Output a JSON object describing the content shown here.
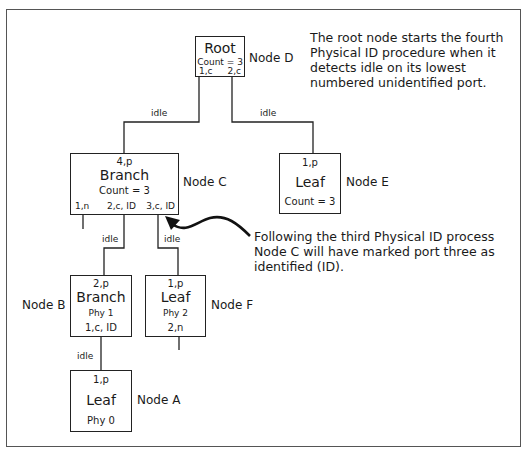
{
  "nodes": {
    "root": {
      "title": "Root",
      "count": "Count = 3",
      "port1": "1,c",
      "port2": "2,c",
      "label": "Node D"
    },
    "c": {
      "top": "4,p",
      "title": "Branch",
      "count": "Count = 3",
      "port1": "1,n",
      "port2": "2,c, ID",
      "port3": "3,c, ID",
      "label": "Node C"
    },
    "e": {
      "top": "1,p",
      "title": "Leaf",
      "count": "Count = 3",
      "label": "Node E"
    },
    "b": {
      "top": "2,p",
      "title": "Branch",
      "phy": "Phy 1",
      "port": "1,c, ID",
      "label": "Node B"
    },
    "f": {
      "top": "1,p",
      "title": "Leaf",
      "phy": "Phy 2",
      "port": "2,n",
      "label": "Node F"
    },
    "a": {
      "top": "1,p",
      "title": "Leaf",
      "phy": "Phy 0",
      "label": "Node A"
    }
  },
  "edges": {
    "root_to_c": "idle",
    "root_to_e": "idle",
    "c_to_b": "idle",
    "c_to_f": "idle",
    "b_to_a": "idle"
  },
  "notes": {
    "root_note": "The root node starts the fourth Physical ID procedure when it detects idle on its lowest numbered unidentified port.",
    "c_note": "Following the third Physical ID process Node C will have marked port three as identified (ID)."
  },
  "colors": {
    "line": "#222222",
    "frame": "#555555",
    "background": "#ffffff"
  }
}
